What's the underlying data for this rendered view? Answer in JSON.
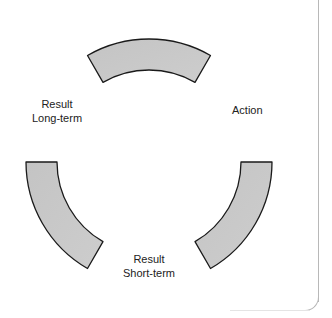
{
  "diagram": {
    "type": "cycle",
    "segments": [
      {
        "id": "top",
        "start_deg": 240,
        "end_deg": 300
      },
      {
        "id": "right",
        "start_deg": 0,
        "end_deg": 60
      },
      {
        "id": "left",
        "start_deg": 120,
        "end_deg": 180
      }
    ],
    "labels": {
      "action": "Action",
      "short_term_line1": "Result",
      "short_term_line2": "Short-term",
      "long_term_line1": "Result",
      "long_term_line2": "Long-term"
    },
    "colors": {
      "fill": "#c8c8c8",
      "stroke": "#1a1a1a",
      "frame": "#b8b8b8"
    },
    "geometry": {
      "cx": 149,
      "cy": 162,
      "outer_r": 123,
      "inner_r": 92
    }
  }
}
